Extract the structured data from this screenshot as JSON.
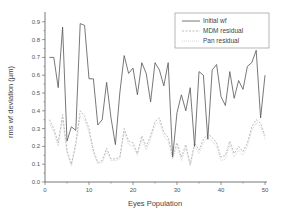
{
  "chart_data": {
    "type": "line",
    "title": "",
    "xlabel": "Eyes Population",
    "ylabel": "rms wf deviation (µm)",
    "xlim": [
      0,
      50
    ],
    "ylim": [
      0,
      0.95
    ],
    "xticks": [
      0,
      10,
      20,
      30,
      40,
      50
    ],
    "yticks": [
      0.0,
      0.1,
      0.2,
      0.3,
      0.4,
      0.5,
      0.6,
      0.7,
      0.8,
      0.9
    ],
    "grid": false,
    "legend_position": "upper right",
    "x": [
      1,
      2,
      3,
      4,
      5,
      6,
      7,
      8,
      9,
      10,
      11,
      12,
      13,
      14,
      15,
      16,
      17,
      18,
      19,
      20,
      21,
      22,
      23,
      24,
      25,
      26,
      27,
      28,
      29,
      30,
      31,
      32,
      33,
      34,
      35,
      36,
      37,
      38,
      39,
      40,
      41,
      42,
      43,
      44,
      45,
      46,
      47,
      48,
      49,
      50
    ],
    "series": [
      {
        "name": "Initial wf",
        "style": "solid",
        "color": "#555555",
        "values": [
          0.7,
          0.7,
          0.53,
          0.87,
          0.23,
          0.31,
          0.29,
          0.89,
          0.88,
          0.58,
          0.58,
          0.32,
          0.35,
          0.56,
          0.36,
          0.21,
          0.5,
          0.71,
          0.61,
          0.64,
          0.49,
          0.67,
          0.61,
          0.45,
          0.67,
          0.63,
          0.54,
          0.67,
          0.14,
          0.39,
          0.49,
          0.4,
          0.53,
          0.2,
          0.62,
          0.6,
          0.24,
          0.63,
          0.66,
          0.48,
          0.43,
          0.62,
          0.47,
          0.57,
          0.52,
          0.65,
          0.67,
          0.74,
          0.36,
          0.6
        ]
      },
      {
        "name": "MDM residual",
        "style": "dashed",
        "color": "#aaaaaa",
        "values": [
          0.35,
          0.3,
          0.22,
          0.38,
          0.18,
          0.1,
          0.22,
          0.4,
          0.37,
          0.3,
          0.18,
          0.11,
          0.12,
          0.19,
          0.13,
          0.13,
          0.14,
          0.3,
          0.23,
          0.22,
          0.16,
          0.26,
          0.2,
          0.26,
          0.34,
          0.36,
          0.28,
          0.25,
          0.15,
          0.22,
          0.14,
          0.21,
          0.1,
          0.22,
          0.18,
          0.24,
          0.27,
          0.25,
          0.22,
          0.14,
          0.15,
          0.23,
          0.16,
          0.2,
          0.17,
          0.22,
          0.31,
          0.35,
          0.33,
          0.26
        ]
      },
      {
        "name": "Pan residual",
        "style": "dotted",
        "color": "#cccccc",
        "values": [
          0.33,
          0.28,
          0.2,
          0.35,
          0.16,
          0.09,
          0.2,
          0.37,
          0.35,
          0.28,
          0.16,
          0.1,
          0.11,
          0.17,
          0.12,
          0.12,
          0.13,
          0.28,
          0.21,
          0.2,
          0.15,
          0.24,
          0.18,
          0.24,
          0.32,
          0.34,
          0.26,
          0.23,
          0.13,
          0.2,
          0.12,
          0.19,
          0.09,
          0.2,
          0.16,
          0.22,
          0.25,
          0.23,
          0.2,
          0.12,
          0.13,
          0.21,
          0.14,
          0.18,
          0.15,
          0.2,
          0.29,
          0.33,
          0.31,
          0.24
        ]
      }
    ]
  }
}
